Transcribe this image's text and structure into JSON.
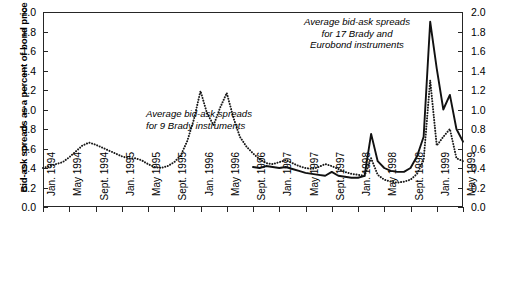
{
  "chart_data": {
    "type": "line",
    "title": "",
    "xlabel": "",
    "ylabel": "Bid-ask spreads as a percent of bond price",
    "ylim": [
      0.0,
      2.0
    ],
    "ytick_values": [
      0.0,
      0.2,
      0.4,
      0.6,
      0.8,
      1.0,
      1.2,
      1.4,
      1.6,
      1.8,
      2.0
    ],
    "ytick_labels": [
      "0.0",
      "0.2",
      "0.4",
      "0.6",
      "0.8",
      "1.0",
      "1.2",
      "1.4",
      "1.6",
      "1.8",
      "2.0"
    ],
    "ytick_labels_right": [
      "0.0",
      "0.2",
      "0.4",
      "0.6",
      "0.8",
      "1.0",
      "1.2",
      "1.4",
      "1.6",
      "1.8",
      "2.0"
    ],
    "grid": false,
    "legend_position": "annotations-inline",
    "x_tick_labels": [
      "Jan. 1994",
      "May 1994",
      "Sept. 1994",
      "Jan. 1995",
      "May 1995",
      "Sept. 1995",
      "Jan. 1996",
      "May 1996",
      "Sept. 1996",
      "Jan. 1997",
      "May 1997",
      "Sept. 1997",
      "Jan. 1998",
      "May 1998",
      "Sept. 1998",
      "Jan. 1999",
      "May 1999"
    ],
    "x_range": [
      "Jan. 1994",
      "May 1999"
    ],
    "annotations": [
      {
        "name": "brady9",
        "text": "Average bid-ask spreads\nfor 9 Brady instruments"
      },
      {
        "name": "brady17",
        "text": "Average bid-ask spreads\nfor 17 Brady and\nEurobond instruments"
      }
    ],
    "series": [
      {
        "name": "Average bid-ask spreads for 9 Brady instruments",
        "style": "dotted",
        "color": "#1a1a1a",
        "x_months": [
          0,
          1,
          2,
          3,
          4,
          5,
          6,
          7,
          8,
          9,
          10,
          11,
          12,
          13,
          14,
          15,
          16,
          17,
          18,
          19,
          20,
          21,
          22,
          23,
          24,
          25,
          26,
          27,
          28,
          29,
          30,
          31,
          32,
          33,
          34,
          35,
          36,
          37,
          38,
          39,
          40,
          41,
          42,
          43,
          44,
          45,
          46,
          47,
          48,
          49,
          50,
          51,
          52,
          53,
          54,
          55,
          56,
          57,
          58,
          59,
          60,
          61,
          62,
          63,
          64
        ],
        "values": [
          0.4,
          0.43,
          0.45,
          0.47,
          0.52,
          0.58,
          0.63,
          0.66,
          0.64,
          0.6,
          0.57,
          0.54,
          0.51,
          0.5,
          0.5,
          0.48,
          0.44,
          0.41,
          0.4,
          0.42,
          0.46,
          0.52,
          0.62,
          0.8,
          1.05,
          1.19,
          0.98,
          0.88,
          1.05,
          1.17,
          1.0,
          0.8,
          0.68,
          0.6,
          0.55,
          0.52,
          0.5,
          0.48,
          0.46,
          0.44,
          0.42,
          0.4,
          0.38,
          0.36,
          0.35,
          0.36,
          0.4,
          0.44,
          0.48,
          0.46,
          0.41,
          0.38,
          0.36,
          0.34,
          0.33,
          0.32,
          0.31,
          0.3,
          0.29,
          0.28,
          0.27,
          0.26,
          0.25,
          0.24,
          0.23
        ]
      },
      {
        "name": "Average bid-ask spreads for 17 Brady and Eurobond instruments",
        "style": "solid",
        "color": "#111111",
        "x_start_label": "Sept. 1996",
        "x_months": [
          32,
          33,
          34,
          35,
          36,
          37,
          38,
          39,
          40,
          41,
          42,
          43,
          44,
          45,
          46,
          47,
          48,
          49,
          50,
          51,
          52,
          53,
          54,
          55,
          56,
          57,
          58,
          59,
          60,
          61,
          62,
          63,
          64
        ],
        "values": [
          0.41,
          0.4,
          0.42,
          0.41,
          0.39,
          0.4,
          0.38,
          0.36,
          0.34,
          0.33,
          0.32,
          0.31,
          0.34,
          0.31,
          0.3,
          0.3,
          0.3,
          0.32,
          0.75,
          0.48,
          0.4,
          0.37,
          0.36,
          0.36,
          0.4,
          0.52,
          0.7,
          1.9,
          1.45,
          1.02,
          1.15,
          0.85,
          0.67
        ]
      }
    ],
    "dotted_series_points": [
      [
        0,
        0.4
      ],
      [
        1,
        0.43
      ],
      [
        2,
        0.45
      ],
      [
        3,
        0.47
      ],
      [
        4,
        0.52
      ],
      [
        5,
        0.58
      ],
      [
        6,
        0.63
      ],
      [
        7,
        0.66
      ],
      [
        8,
        0.63
      ],
      [
        9,
        0.59
      ],
      [
        10,
        0.56
      ],
      [
        11,
        0.54
      ],
      [
        12,
        0.52
      ],
      [
        13,
        0.5
      ],
      [
        14,
        0.5
      ],
      [
        15,
        0.47
      ],
      [
        16,
        0.43
      ],
      [
        17,
        0.41
      ],
      [
        18,
        0.4
      ],
      [
        19,
        0.43
      ],
      [
        20,
        0.47
      ],
      [
        21,
        0.55
      ],
      [
        22,
        0.7
      ],
      [
        23,
        0.92
      ],
      [
        24,
        1.19
      ],
      [
        25,
        1.0
      ],
      [
        26,
        0.86
      ],
      [
        27,
        1.0
      ],
      [
        28,
        1.17
      ],
      [
        29,
        0.97
      ],
      [
        30,
        0.78
      ],
      [
        31,
        0.66
      ],
      [
        32,
        0.58
      ],
      [
        33,
        0.53
      ],
      [
        34,
        0.5
      ],
      [
        35,
        0.52
      ],
      [
        36,
        0.54
      ],
      [
        37,
        0.52
      ],
      [
        38,
        0.48
      ],
      [
        39,
        0.45
      ],
      [
        40,
        0.42
      ],
      [
        41,
        0.4
      ],
      [
        42,
        0.42
      ],
      [
        43,
        0.47
      ],
      [
        44,
        0.53
      ],
      [
        45,
        0.49
      ],
      [
        46,
        0.43
      ],
      [
        47,
        0.4
      ],
      [
        48,
        0.38
      ],
      [
        49,
        0.35
      ],
      [
        50,
        0.32
      ],
      [
        51,
        0.31
      ],
      [
        52,
        0.3
      ],
      [
        53,
        0.29
      ],
      [
        54,
        0.31
      ],
      [
        55,
        0.3
      ],
      [
        56,
        0.28
      ],
      [
        57,
        0.27
      ],
      [
        58,
        0.26
      ],
      [
        59,
        0.26
      ],
      [
        60,
        0.25
      ],
      [
        61,
        0.24
      ],
      [
        62,
        0.23
      ],
      [
        63,
        0.22
      ],
      [
        64,
        0.22
      ]
    ],
    "peaks": [
      {
        "label": "first 1995 peak",
        "value": 1.19,
        "series": "dotted"
      },
      {
        "label": "second 1995 peak",
        "value": 1.17,
        "series": "dotted"
      },
      {
        "label": "Sept. 1998 peak",
        "value": 1.9,
        "series": "solid"
      },
      {
        "label": "Sept. 1998 peak",
        "value": 1.3,
        "series": "dotted"
      },
      {
        "label": "late 1997 spike",
        "value": 0.75,
        "series": "solid"
      },
      {
        "label": "Jan. 1999 secondary peak",
        "value": 1.15,
        "series": "solid"
      }
    ]
  }
}
